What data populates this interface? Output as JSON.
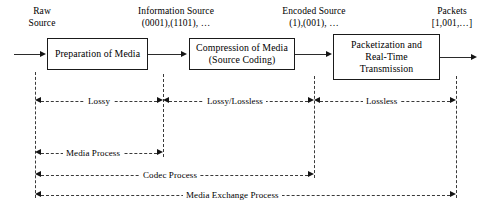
{
  "figure": {
    "signal_labels": [
      {
        "id": "raw-source",
        "line1": "Raw",
        "line2": "Source",
        "x": 14,
        "y": 6,
        "width": 56
      },
      {
        "id": "information-source",
        "line1": "Information Source",
        "line2": "(0001),(1101), …",
        "x": 112,
        "y": 6,
        "width": 128
      },
      {
        "id": "encoded-source",
        "line1": "Encoded Source",
        "line2": "(1),(001), …",
        "x": 262,
        "y": 6,
        "width": 104
      },
      {
        "id": "packets",
        "line1": "Packets",
        "line2": "[1,001,…]",
        "x": 416,
        "y": 6,
        "width": 72
      }
    ],
    "boxes": [
      {
        "id": "preparation-of-media",
        "line1": "Preparation of Media",
        "line2": "",
        "line3": "",
        "x": 47,
        "y": 38,
        "width": 101,
        "height": 32
      },
      {
        "id": "compression-of-media",
        "line1": "Compression of Media",
        "line2": "(Source Coding)",
        "line3": "",
        "x": 189,
        "y": 38,
        "width": 106,
        "height": 32
      },
      {
        "id": "packetization-and-rtt",
        "line1": "Packetization and",
        "line2": "Real-Time",
        "line3": "Transmission",
        "x": 333,
        "y": 34,
        "width": 107,
        "height": 46
      }
    ],
    "verticals": [
      {
        "id": "guide-raw",
        "x": 35,
        "y": 72,
        "height": 126
      },
      {
        "id": "guide-info",
        "x": 163,
        "y": 74,
        "height": 83
      },
      {
        "id": "guide-encoded",
        "x": 314,
        "y": 76,
        "height": 102
      },
      {
        "id": "guide-packets",
        "x": 456,
        "y": 76,
        "height": 122
      }
    ],
    "measures": [
      {
        "id": "lossy",
        "label": "Lossy",
        "x1": 35,
        "x2": 163,
        "y": 95
      },
      {
        "id": "lossy-lossless",
        "label": "Lossy/Lossless",
        "x1": 163,
        "x2": 314,
        "y": 95
      },
      {
        "id": "lossless",
        "label": "Lossless",
        "x1": 314,
        "x2": 456,
        "y": 95
      },
      {
        "id": "media-process",
        "label": "Media Process",
        "x1": 35,
        "x2": 163,
        "y": 147
      },
      {
        "id": "codec-process",
        "label": "Codec Process",
        "x1": 35,
        "x2": 314,
        "y": 169
      },
      {
        "id": "media-exchange-process",
        "label": "Media Exchange Process",
        "x1": 35,
        "x2": 456,
        "y": 189
      }
    ],
    "flow_arrows": [
      {
        "id": "flow-in-to-preparation",
        "x1": 14,
        "x2": 47,
        "y": 54
      },
      {
        "id": "flow-preparation-to-compression",
        "x1": 148,
        "x2": 189,
        "y": 54
      },
      {
        "id": "flow-compression-to-packetization",
        "x1": 295,
        "x2": 333,
        "y": 54
      },
      {
        "id": "flow-packetization-out",
        "x1": 440,
        "x2": 478,
        "y": 57
      }
    ],
    "colors": {
      "stroke": "#1a1a1a",
      "dash": "#3a3a3a",
      "background": "#ffffff"
    }
  }
}
